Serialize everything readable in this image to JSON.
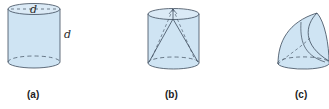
{
  "figures": [
    {
      "id": "a",
      "caption": "(a)",
      "shape": "cylinder",
      "labels": {
        "diameter": "d",
        "height": "d"
      }
    },
    {
      "id": "b",
      "caption": "(b)",
      "shape": "cylinder-with-inscribed-curves"
    },
    {
      "id": "c",
      "caption": "(c)",
      "shape": "curved-intersection-solid"
    }
  ],
  "colors": {
    "fill": "#cfe4f3",
    "fill_top": "#dbeaf6",
    "stroke": "#3c4a5a"
  }
}
